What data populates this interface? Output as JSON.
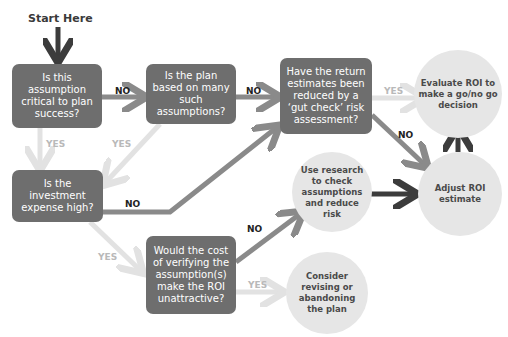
{
  "start_label": "Start Here",
  "colors": {
    "decision_box": "#6e6e6e",
    "outcome_circle": "#e6e6e6",
    "no_arrow": "#8a8a8a",
    "yes_arrow": "#e2e2e2",
    "strong_arrow": "#3c3c3c"
  },
  "decisions": {
    "critical": "Is this assumption critical to plan success?",
    "many": "Is the plan based on many such assumptions?",
    "gutcheck": "Have the return estimates been reduced by a ‘gut check’ risk assessment?",
    "expense": "Is the investment expense high?",
    "verify": "Would the cost of verifying the assumption(s) make the ROI unattractive?"
  },
  "outcomes": {
    "evaluate": "Evaluate ROI to make a go/no go decision",
    "research": "Use research to check assumptions and reduce risk",
    "adjust": "Adjust ROI estimate",
    "revise": "Consider revising or abandoning the plan"
  },
  "labels": {
    "no1": "NO",
    "no2": "NO",
    "yes_gut": "YES",
    "no_gut": "NO",
    "yes_crit": "YES",
    "yes_many": "YES",
    "no_expense": "NO",
    "yes_expense": "YES",
    "no_verify": "NO",
    "yes_verify": "YES"
  }
}
